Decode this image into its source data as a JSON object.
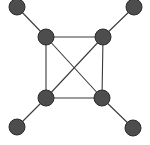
{
  "diagram": {
    "type": "graph",
    "colors": {
      "node_fill": "#4d4d4d",
      "node_stroke": "#2b2b2b",
      "edge": "#3a3a3a",
      "background": "#ffffff"
    },
    "node_radius": 8,
    "nodes": [
      {
        "id": "outer-tl",
        "x": 17,
        "y": 7
      },
      {
        "id": "outer-tr",
        "x": 134,
        "y": 7
      },
      {
        "id": "inner-tl",
        "x": 46,
        "y": 37
      },
      {
        "id": "inner-tr",
        "x": 103,
        "y": 37
      },
      {
        "id": "inner-bl",
        "x": 46,
        "y": 98
      },
      {
        "id": "inner-br",
        "x": 102,
        "y": 98
      },
      {
        "id": "outer-bl",
        "x": 17,
        "y": 127
      },
      {
        "id": "outer-br",
        "x": 133,
        "y": 128
      }
    ],
    "edges": [
      [
        "outer-tl",
        "inner-tl"
      ],
      [
        "outer-tr",
        "inner-tr"
      ],
      [
        "outer-bl",
        "inner-bl"
      ],
      [
        "outer-br",
        "inner-br"
      ],
      [
        "inner-tl",
        "inner-tr"
      ],
      [
        "inner-tr",
        "inner-br"
      ],
      [
        "inner-br",
        "inner-bl"
      ],
      [
        "inner-bl",
        "inner-tl"
      ],
      [
        "inner-tl",
        "inner-br"
      ],
      [
        "inner-tr",
        "inner-bl"
      ]
    ]
  }
}
